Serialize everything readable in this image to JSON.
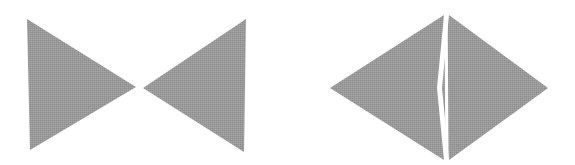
{
  "figure": {
    "background_color": "#ffffff",
    "fill_color": "#9a9a9a",
    "fill_style": "halftone-dither-gray",
    "edge_color": "#8e8e8e",
    "canvas": {
      "width": 575,
      "height": 165
    },
    "panels": [
      {
        "name": "bowtie-figure",
        "label": "",
        "description": "Two solid gray triangles meeting apex-to-apex forming a bowtie / hourglass outline",
        "shapes": [
          {
            "name": "left-triangle",
            "type": "polygon",
            "points": "27,19 30,150 136,87",
            "fill": "#9a9a9a"
          },
          {
            "name": "right-triangle",
            "type": "polygon",
            "points": "246,19 244,152 143,88",
            "fill": "#9a9a9a"
          }
        ]
      },
      {
        "name": "split-diamond-figure",
        "label": "",
        "description": "A solid gray rhombus divided by a thin vertical white seam into a left and a right half",
        "shapes": [
          {
            "name": "diamond-left-half",
            "type": "polygon",
            "points": "330,88 444,15 437,88 444,160",
            "fill": "#9a9a9a"
          },
          {
            "name": "diamond-right-half",
            "type": "polygon",
            "points": "449,15 548,88 449,160 442,88",
            "fill": "#9a9a9a"
          },
          {
            "name": "diamond-seam",
            "type": "line",
            "points": "446,15 447,160",
            "fill": "#ffffff"
          }
        ]
      }
    ]
  }
}
